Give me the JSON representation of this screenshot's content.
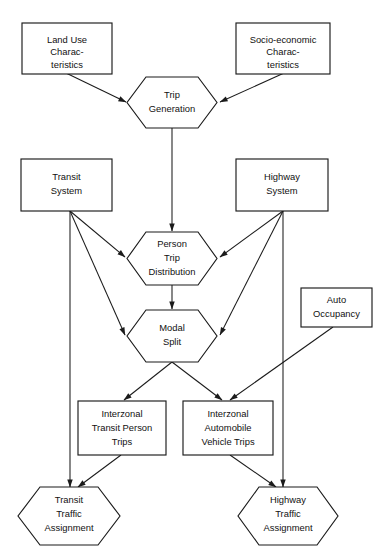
{
  "diagram": {
    "line_color": "#1b1b1b",
    "fill_color": "#ffffff",
    "nodes": [
      {
        "id": "land-use",
        "shape": "rectangle",
        "lines": [
          "Land Use",
          "Charac-",
          "teristics"
        ]
      },
      {
        "id": "socio-economic",
        "shape": "rectangle",
        "lines": [
          "Socio-economic",
          "Charac-",
          "teristics"
        ]
      },
      {
        "id": "trip-generation",
        "shape": "hexagon",
        "lines": [
          "Trip",
          "Generation"
        ]
      },
      {
        "id": "transit-system",
        "shape": "rectangle",
        "lines": [
          "Transit",
          "System"
        ]
      },
      {
        "id": "highway-system",
        "shape": "rectangle",
        "lines": [
          "Highway",
          "System"
        ]
      },
      {
        "id": "person-trip-distribution",
        "shape": "hexagon",
        "lines": [
          "Person",
          "Trip",
          "Distribution"
        ]
      },
      {
        "id": "modal-split",
        "shape": "hexagon",
        "lines": [
          "Modal",
          "Split"
        ]
      },
      {
        "id": "auto-occupancy",
        "shape": "rectangle",
        "lines": [
          "Auto",
          "Occupancy"
        ]
      },
      {
        "id": "interzonal-transit-person-trips",
        "shape": "rectangle",
        "lines": [
          "Interzonal",
          "Transit Person",
          "Trips"
        ]
      },
      {
        "id": "interzonal-automobile-vehicle-trips",
        "shape": "rectangle",
        "lines": [
          "Interzonal",
          "Automobile",
          "Vehicle Trips"
        ]
      },
      {
        "id": "transit-traffic-assignment",
        "shape": "hexagon",
        "lines": [
          "Transit",
          "Traffic",
          "Assignment"
        ]
      },
      {
        "id": "highway-traffic-assignment",
        "shape": "hexagon",
        "lines": [
          "Highway",
          "Traffic",
          "Assignment"
        ]
      }
    ],
    "edges": [
      {
        "id": "edge-land-use-to-trip-generation",
        "from": "land-use",
        "to": "trip-generation",
        "arrow": true
      },
      {
        "id": "edge-socio-economic-to-trip-generation",
        "from": "socio-economic",
        "to": "trip-generation",
        "arrow": true
      },
      {
        "id": "edge-trip-generation-to-person-trip-distribution",
        "from": "trip-generation",
        "to": "person-trip-distribution",
        "arrow": true
      },
      {
        "id": "edge-transit-system-to-person-trip-distribution",
        "from": "transit-system",
        "to": "person-trip-distribution",
        "arrow": true
      },
      {
        "id": "edge-transit-system-to-modal-split",
        "from": "transit-system",
        "to": "modal-split",
        "arrow": true
      },
      {
        "id": "edge-transit-system-to-transit-traffic-assignment",
        "from": "transit-system",
        "to": "transit-traffic-assignment",
        "arrow": true
      },
      {
        "id": "edge-highway-system-to-person-trip-distribution",
        "from": "highway-system",
        "to": "person-trip-distribution",
        "arrow": true
      },
      {
        "id": "edge-highway-system-to-modal-split",
        "from": "highway-system",
        "to": "modal-split",
        "arrow": true
      },
      {
        "id": "edge-highway-system-to-highway-traffic-assignment",
        "from": "highway-system",
        "to": "highway-traffic-assignment",
        "arrow": true
      },
      {
        "id": "edge-person-trip-distribution-to-modal-split",
        "from": "person-trip-distribution",
        "to": "modal-split",
        "arrow": true
      },
      {
        "id": "edge-modal-split-to-interzonal-transit",
        "from": "modal-split",
        "to": "interzonal-transit-person-trips",
        "arrow": true
      },
      {
        "id": "edge-modal-split-to-interzonal-automobile",
        "from": "modal-split",
        "to": "interzonal-automobile-vehicle-trips",
        "arrow": true
      },
      {
        "id": "edge-auto-occupancy-to-interzonal-automobile",
        "from": "auto-occupancy",
        "to": "interzonal-automobile-vehicle-trips",
        "arrow": true
      },
      {
        "id": "edge-interzonal-transit-to-transit-assignment",
        "from": "interzonal-transit-person-trips",
        "to": "transit-traffic-assignment",
        "arrow": true
      },
      {
        "id": "edge-interzonal-automobile-to-highway-assignment",
        "from": "interzonal-automobile-vehicle-trips",
        "to": "highway-traffic-assignment",
        "arrow": true
      }
    ]
  }
}
